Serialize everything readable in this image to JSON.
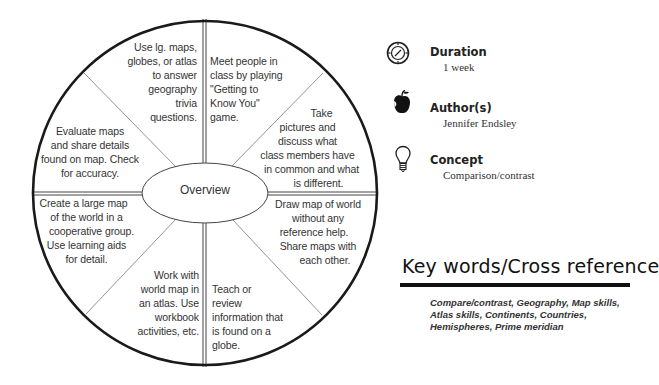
{
  "wheel": {
    "center_label": "Overview",
    "segments": [
      {
        "position": "top-left",
        "text": "Use lg. maps, globes, or atlas to answer geography trivia questions.",
        "lines": [
          "Use lg. maps,",
          "globes, or atlas",
          "to answer",
          "geography",
          "trivia",
          "questions."
        ]
      },
      {
        "position": "top-right",
        "text": "Meet people in class by playing \"Getting to Know You\" game.",
        "lines": [
          "Meet people in",
          "class by playing",
          "\"Getting to",
          "Know You\"",
          "game."
        ]
      },
      {
        "position": "right-upper",
        "text": "Take pictures and discuss what class members have in common and what is different.",
        "lines": [
          "Take",
          "pictures and",
          "discuss what",
          "class members have",
          "in common and what",
          "is different."
        ]
      },
      {
        "position": "right-lower",
        "text": "Draw map of world without any reference help. Share maps with each other.",
        "lines": [
          "Draw map of world",
          "without any",
          "reference help.",
          "Share maps with",
          "each other."
        ]
      },
      {
        "position": "bottom-right",
        "text": "Teach or review information that is found on a globe.",
        "lines": [
          "Teach or",
          "review",
          "information that",
          "is found on a",
          "globe."
        ]
      },
      {
        "position": "bottom-left",
        "text": "Work with world map in an atlas. Use workbook activities, etc.",
        "lines": [
          "Work with",
          "world map in",
          "an atlas.  Use",
          "workbook",
          "activities, etc."
        ]
      },
      {
        "position": "left-lower",
        "text": "Create a large map of the world in a cooperative group. Use learning aids for detail.",
        "lines": [
          "Create a large map",
          "of the world in a",
          "cooperative group.",
          "Use learning aids",
          "for detail."
        ]
      },
      {
        "position": "left-upper",
        "text": "Evaluate maps and share details found on map. Check for accuracy.",
        "lines": [
          "Evaluate maps",
          "and share details",
          "found on map.  Check",
          "for accuracy."
        ]
      }
    ]
  },
  "info": {
    "duration": {
      "icon": "compass-clock-icon",
      "label": "Duration",
      "value": "1 week"
    },
    "authors": {
      "icon": "apple-icon",
      "label": "Author(s)",
      "value": "Jennifer Endsley"
    },
    "concept": {
      "icon": "lightbulb-icon",
      "label": "Concept",
      "value": "Comparison/contrast"
    }
  },
  "keywords": {
    "title": "Key words/Cross reference",
    "lines": [
      "Compare/contrast, Geography, Map skills,",
      "Atlas skills, Continents, Countries,",
      "Hemispheres, Prime meridian"
    ],
    "text": "Compare/contrast, Geography, Map skills, Atlas skills, Continents, Countries, Hemispheres, Prime meridian"
  }
}
